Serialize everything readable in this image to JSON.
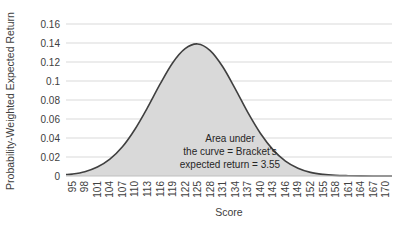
{
  "chart_data": {
    "type": "area",
    "title": "",
    "xlabel": "Score",
    "ylabel": "Probability-Weighted Expected Return",
    "categories": [
      95,
      98,
      101,
      104,
      107,
      110,
      113,
      116,
      119,
      122,
      125,
      128,
      131,
      134,
      137,
      140,
      143,
      146,
      149,
      152,
      155,
      158,
      161,
      164,
      167,
      170
    ],
    "series": [
      {
        "name": "Probability-Weighted Expected Return",
        "values": [
          0.002,
          0.0045,
          0.0094,
          0.0177,
          0.0307,
          0.0492,
          0.0719,
          0.0966,
          0.119,
          0.134,
          0.139,
          0.132,
          0.115,
          0.0917,
          0.0669,
          0.045,
          0.0278,
          0.0157,
          0.0082,
          0.0038,
          0.0017,
          0.0007,
          0.0003,
          0.0001,
          0.0,
          0.0
        ]
      }
    ],
    "yticks": [
      "0",
      "0.02",
      "0.04",
      "0.06",
      "0.08",
      "0.1",
      "0.12",
      "0.14",
      "0.16"
    ],
    "ylim": [
      0,
      0.16
    ],
    "grid": true,
    "legend": "none",
    "annotation": {
      "line1": "Area under",
      "line2": "the curve = Bracket's",
      "line3": "expected return = 3.55"
    },
    "colors": {
      "fill": "#d9d9d9",
      "line": "#404040",
      "grid": "#d9d9d9",
      "axis": "#bfbfbf"
    }
  }
}
